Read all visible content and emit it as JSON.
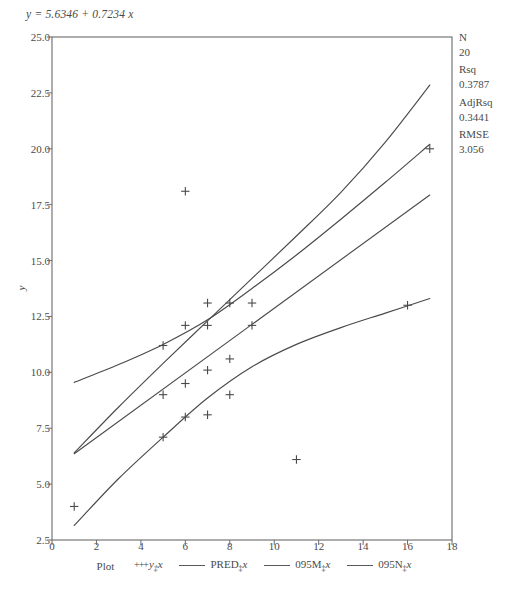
{
  "equation": "y = 5.6346 + 0.7234 x",
  "stats": [
    {
      "label": "N",
      "value": "20"
    },
    {
      "label": "Rsq",
      "value": "0.3787"
    },
    {
      "label": "AdjRsq",
      "value": "0.3441"
    },
    {
      "label": "RMSE",
      "value": "3.056"
    }
  ],
  "legend": {
    "title": "Plot",
    "points_label": "y*x",
    "pred_label": "PRED*x",
    "upper_label": "095M*x",
    "lower_label": "095N*x"
  },
  "chart_data": {
    "type": "scatter",
    "title": "",
    "xlabel": "",
    "ylabel": "y",
    "xlim": [
      0,
      18
    ],
    "ylim": [
      2.5,
      25.0
    ],
    "xticks": [
      0,
      2,
      4,
      6,
      8,
      10,
      12,
      14,
      16,
      18
    ],
    "yticks": [
      2.5,
      5.0,
      7.5,
      10.0,
      12.5,
      15.0,
      17.5,
      20.0,
      22.5,
      25.0
    ],
    "grid": false,
    "legend_position": "bottom",
    "fit": {
      "intercept": 5.6346,
      "slope": 0.7234,
      "equation": "y = 5.6346 + 0.7234 x",
      "n": 20,
      "rsq": 0.3787,
      "adj_rsq": 0.3441,
      "rmse": 3.056
    },
    "points": [
      {
        "x": 1,
        "y": 4.0
      },
      {
        "x": 5,
        "y": 7.1
      },
      {
        "x": 5,
        "y": 9.0
      },
      {
        "x": 5,
        "y": 11.2
      },
      {
        "x": 6,
        "y": 8.0
      },
      {
        "x": 6,
        "y": 9.5
      },
      {
        "x": 6,
        "y": 12.1
      },
      {
        "x": 6,
        "y": 18.1
      },
      {
        "x": 7,
        "y": 8.1
      },
      {
        "x": 7,
        "y": 10.1
      },
      {
        "x": 7,
        "y": 12.1
      },
      {
        "x": 7,
        "y": 13.1
      },
      {
        "x": 8,
        "y": 9.0
      },
      {
        "x": 8,
        "y": 10.6
      },
      {
        "x": 8,
        "y": 13.1
      },
      {
        "x": 9,
        "y": 12.1
      },
      {
        "x": 9,
        "y": 13.1
      },
      {
        "x": 11,
        "y": 6.1
      },
      {
        "x": 16,
        "y": 13.0
      },
      {
        "x": 17,
        "y": 20.0
      }
    ],
    "series": [
      {
        "name": "PRED*x",
        "type": "line",
        "x": [
          1,
          17
        ],
        "values": [
          6.358,
          17.932
        ]
      },
      {
        "name": "095M*x",
        "type": "line",
        "comment": "upper mean confidence band",
        "x": [
          1,
          3,
          5,
          7,
          9,
          11,
          13,
          15,
          17
        ],
        "values": [
          9.55,
          10.35,
          11.25,
          12.35,
          13.75,
          15.25,
          16.85,
          18.5,
          20.2
        ]
      },
      {
        "name": "095N*x",
        "type": "line",
        "comment": "lower confidence band",
        "x": [
          1,
          3,
          5,
          7,
          9,
          11,
          13,
          15,
          17
        ],
        "values": [
          3.15,
          5.25,
          7.1,
          8.85,
          10.25,
          11.25,
          12.0,
          12.65,
          13.3
        ]
      },
      {
        "name": "upper-outer",
        "type": "line",
        "comment": "upper prediction band rising to top-right",
        "x": [
          1,
          3,
          5,
          7,
          9,
          11,
          13,
          15,
          17
        ],
        "values": [
          6.4,
          8.45,
          10.4,
          12.3,
          14.2,
          16.1,
          18.05,
          20.3,
          22.85
        ]
      }
    ]
  }
}
